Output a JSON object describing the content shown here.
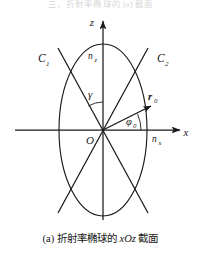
{
  "figure": {
    "top_clipped_text": "三、折射率椭球的 (a) 截面",
    "caption_prefix": "(a)",
    "caption_text_1": "折射率椭球的",
    "caption_axis_plane": "xOz",
    "caption_text_2": "截面",
    "caption_full": "(a) 折射率椭球的 xOz 截面",
    "line_color": "#1a1a1a",
    "background_color": "#ffffff"
  },
  "axes": {
    "x_axis_label": "x",
    "z_axis_label": "z",
    "origin_label": "O",
    "x_axis": {
      "x1": 15,
      "y1": 122,
      "x2": 182,
      "y2": 122
    },
    "z_axis": {
      "x1": 103,
      "y1": 212,
      "x2": 103,
      "y2": 11
    }
  },
  "ellipse": {
    "name": "index-ellipsoid-section",
    "center_x": 103,
    "center_y": 122,
    "semi_axis_x": 44,
    "semi_axis_z": 86,
    "x_intercept_label": "n_x",
    "x_intercept_label_display": "n",
    "x_intercept_sub": "x",
    "z_intercept_label": "n_z",
    "z_intercept_label_display": "n",
    "z_intercept_sub": "z"
  },
  "optic_axes": {
    "c1_label": "C",
    "c1_sub": "1",
    "c1_label_full": "C₁",
    "c2_label": "C",
    "c2_sub": "2",
    "c2_label_full": "C₂",
    "c1_line": {
      "x1": 58,
      "y1": 40,
      "x2": 148,
      "y2": 205
    },
    "c2_line": {
      "x1": 148,
      "y1": 40,
      "x2": 58,
      "y2": 205
    }
  },
  "vectors": {
    "r0_label": "r",
    "r0_sub": "0",
    "r0_label_full": "r₀",
    "r0_line": {
      "x1": 103,
      "y1": 122,
      "x2": 153,
      "y2": 97
    }
  },
  "angles": {
    "gamma_label": "γ",
    "gamma_description": "angle between z-axis and optic axis C2",
    "phi0_label": "φ",
    "phi0_sub": "0",
    "phi0_label_full": "φ₀",
    "phi0_description": "angle between x-axis and vector r0"
  }
}
